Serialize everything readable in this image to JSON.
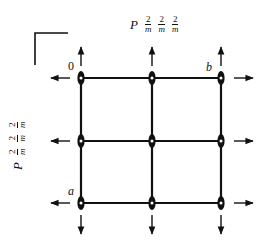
{
  "diagram": {
    "type": "square lattice with 2D symmetry elements",
    "top_symbol": {
      "letter": "P",
      "fractions": [
        {
          "num": "2",
          "den": "m"
        },
        {
          "num": "2",
          "den": "m"
        },
        {
          "num": "2",
          "den": "m"
        }
      ]
    },
    "left_symbol": {
      "letter": "P",
      "fractions": [
        {
          "num": "2",
          "den": "m"
        },
        {
          "num": "2",
          "den": "m"
        },
        {
          "num": "2",
          "den": "m"
        }
      ]
    },
    "labels": {
      "origin": "0",
      "b_axis": "b",
      "a_axis": "a"
    },
    "grid": {
      "columns_x": [
        81,
        152,
        221
      ],
      "rows_y": [
        78,
        141,
        203
      ]
    },
    "colors": {
      "ink": "#111111",
      "background": "#ffffff"
    }
  }
}
